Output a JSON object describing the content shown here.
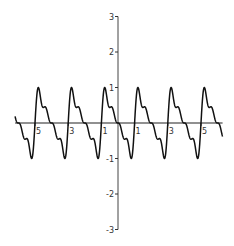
{
  "chart_data": {
    "type": "line",
    "title": "",
    "xlabel": "",
    "ylabel": "",
    "xlim": [
      -6.2,
      6.3
    ],
    "ylim": [
      -3,
      3
    ],
    "grid": false,
    "legend": null,
    "x_ticks": [
      -5,
      -3,
      -1,
      1,
      3,
      5
    ],
    "x_tick_labels": [
      "-5",
      "-3",
      "-1",
      "1",
      "3",
      "5"
    ],
    "y_ticks": [
      3,
      2,
      1,
      -1,
      -2,
      -3
    ],
    "y_tick_labels": [
      "3",
      "2",
      "1",
      "-1",
      "-2",
      "-3"
    ],
    "series": [
      {
        "name": "f(x)",
        "description": "Truncated sawtooth Fourier series, period 2, amplitude ~1, slow stepped descent with steep rise at odd integers",
        "formula": "sum_{n=1..4} sin(n*pi*(x+1))/n, normalized to peak 1",
        "terms": 4,
        "period": 2,
        "amplitude": 1,
        "color": "#111111",
        "sample_points": [
          {
            "x": -6.2,
            "y": 0.4
          },
          {
            "x": -5.6,
            "y": 1.0
          },
          {
            "x": -5.0,
            "y": 0.0
          },
          {
            "x": -4.0,
            "y": 0.0
          },
          {
            "x": -3.6,
            "y": 1.0
          },
          {
            "x": -3.15,
            "y": -1.0
          },
          {
            "x": -2.0,
            "y": 0.0
          },
          {
            "x": -1.6,
            "y": 1.0
          },
          {
            "x": -1.15,
            "y": -1.0
          },
          {
            "x": 0.0,
            "y": 0.0
          },
          {
            "x": 0.85,
            "y": -1.0
          },
          {
            "x": 1.27,
            "y": 1.0
          },
          {
            "x": 2.0,
            "y": 0.0
          },
          {
            "x": 2.85,
            "y": -1.0
          },
          {
            "x": 3.27,
            "y": 1.0
          },
          {
            "x": 4.0,
            "y": 0.0
          },
          {
            "x": 4.85,
            "y": -1.0
          },
          {
            "x": 5.27,
            "y": 1.0
          },
          {
            "x": 6.0,
            "y": 0.0
          },
          {
            "x": 6.3,
            "y": -0.4
          }
        ]
      }
    ]
  },
  "layout": {
    "origin_px": [
      118,
      123
    ],
    "x_px_per_unit": 16.6,
    "y_px_per_unit": 35.5,
    "axis_color": "#222222"
  }
}
